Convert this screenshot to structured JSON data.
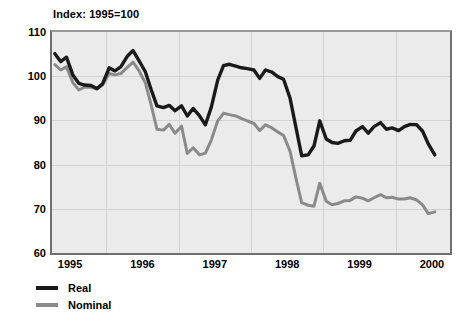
{
  "chart_data": {
    "type": "line",
    "title": "Index: 1995=100",
    "xlabel": "",
    "ylabel": "",
    "ylim": [
      60,
      110
    ],
    "xlim": [
      1994.75,
      2000.25
    ],
    "yticks": [
      60,
      70,
      80,
      90,
      100,
      110
    ],
    "ytick_labels": [
      "60",
      "70",
      "80",
      "90",
      "100",
      "110"
    ],
    "xticks": [
      1995,
      1996,
      1997,
      1998,
      1999,
      2000
    ],
    "xtick_labels": [
      "1995",
      "1996",
      "1997",
      "1998",
      "1999",
      "2000"
    ],
    "grid": true,
    "legend_position": "below-left",
    "colors": {
      "real": "#1a1a1a",
      "nominal": "#8a8a8a",
      "plot_background": "#ebebeb",
      "gridline": "#d2d2d2",
      "frame": "#6f6f6f",
      "text": "#000000"
    },
    "series": [
      {
        "name": "Real",
        "color": "#1a1a1a",
        "x": [
          1994.79,
          1994.87,
          1994.95,
          1995.04,
          1995.12,
          1995.2,
          1995.29,
          1995.37,
          1995.45,
          1995.54,
          1995.62,
          1995.7,
          1995.79,
          1995.87,
          1995.95,
          1996.04,
          1996.12,
          1996.2,
          1996.29,
          1996.37,
          1996.45,
          1996.54,
          1996.62,
          1996.7,
          1996.79,
          1996.87,
          1996.95,
          1997.04,
          1997.12,
          1997.2,
          1997.29,
          1997.37,
          1997.45,
          1997.54,
          1997.62,
          1997.7,
          1997.79,
          1997.87,
          1997.95,
          1998.04,
          1998.12,
          1998.2,
          1998.29,
          1998.37,
          1998.45,
          1998.54,
          1998.62,
          1998.7,
          1998.79,
          1998.87,
          1998.95,
          1999.04,
          1999.12,
          1999.2,
          1999.29,
          1999.37,
          1999.45,
          1999.54,
          1999.62,
          1999.7,
          1999.79,
          1999.87,
          1999.95,
          2000.04
        ],
        "values": [
          105.1,
          103.3,
          104.3,
          100.2,
          98.4,
          98.0,
          97.9,
          97.2,
          98.3,
          101.9,
          101.2,
          102.1,
          104.5,
          105.8,
          103.6,
          101.0,
          97.0,
          93.3,
          92.9,
          93.4,
          92.2,
          93.3,
          91.0,
          92.7,
          91.0,
          89.0,
          92.9,
          99.1,
          102.4,
          102.7,
          102.3,
          101.9,
          101.7,
          101.4,
          99.5,
          101.4,
          100.9,
          99.9,
          99.3,
          95.0,
          88.5,
          82.0,
          82.2,
          84.2,
          89.9,
          85.8,
          85.0,
          84.8,
          85.4,
          85.5,
          87.6,
          88.6,
          87.1,
          88.6,
          89.5,
          88.0,
          88.3,
          87.7,
          88.6,
          89.1,
          89.0,
          87.6,
          84.7,
          82.2
        ]
      },
      {
        "name": "Nominal",
        "color": "#8a8a8a",
        "x": [
          1994.79,
          1994.87,
          1994.95,
          1995.04,
          1995.12,
          1995.2,
          1995.29,
          1995.37,
          1995.45,
          1995.54,
          1995.62,
          1995.7,
          1995.79,
          1995.87,
          1995.95,
          1996.04,
          1996.12,
          1996.2,
          1996.29,
          1996.37,
          1996.45,
          1996.54,
          1996.62,
          1996.7,
          1996.79,
          1996.87,
          1996.95,
          1997.04,
          1997.12,
          1997.2,
          1997.29,
          1997.37,
          1997.45,
          1997.54,
          1997.62,
          1997.7,
          1997.79,
          1997.87,
          1997.95,
          1998.04,
          1998.12,
          1998.2,
          1998.29,
          1998.37,
          1998.45,
          1998.54,
          1998.62,
          1998.7,
          1998.79,
          1998.87,
          1998.95,
          1999.04,
          1999.12,
          1999.2,
          1999.29,
          1999.37,
          1999.45,
          1999.54,
          1999.62,
          1999.7,
          1999.79,
          1999.87,
          1999.95,
          2000.04
        ],
        "values": [
          102.6,
          101.4,
          102.1,
          98.5,
          96.9,
          97.5,
          97.5,
          97.1,
          98.0,
          100.6,
          100.3,
          100.6,
          102.0,
          103.2,
          101.3,
          98.5,
          93.5,
          88.0,
          87.8,
          89.1,
          87.1,
          88.7,
          82.5,
          83.8,
          82.2,
          82.6,
          85.5,
          89.9,
          91.6,
          91.3,
          91.0,
          90.4,
          89.9,
          89.3,
          87.7,
          89.0,
          88.3,
          87.4,
          86.6,
          83.0,
          77.0,
          71.4,
          70.8,
          70.6,
          75.8,
          71.7,
          70.9,
          71.2,
          71.8,
          71.9,
          72.7,
          72.4,
          71.8,
          72.5,
          73.2,
          72.5,
          72.6,
          72.2,
          72.2,
          72.5,
          72.0,
          70.9,
          68.9,
          69.3
        ]
      }
    ]
  }
}
